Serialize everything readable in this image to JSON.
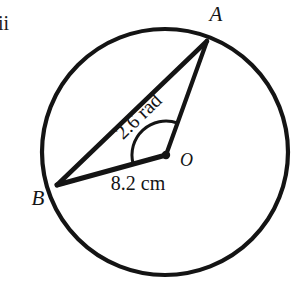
{
  "figure": {
    "kind": "circle-sector-geometry-diagram",
    "background_color": "#ffffff",
    "ink_color": "#141414",
    "question_marker": "ii",
    "circle": {
      "center_label": "O",
      "center_x": 165,
      "center_y": 152,
      "radius": 123,
      "stroke_width": 4.2
    },
    "points": [
      {
        "label": "A",
        "x": 207,
        "y": 41,
        "label_x": 216,
        "label_y": 21
      },
      {
        "label": "B",
        "x": 57,
        "y": 185,
        "label_x": 38,
        "label_y": 205
      },
      {
        "label": "O",
        "x": 166,
        "y": 155,
        "label_x": 180,
        "label_y": 166
      }
    ],
    "segments": [
      {
        "name": "radius-OA",
        "from": "O",
        "to": "A",
        "stroke_width": 4.2
      },
      {
        "name": "radius-OB",
        "from": "O",
        "to": "B",
        "stroke_width": 5.0
      },
      {
        "name": "chord-BA",
        "from": "B",
        "to": "A",
        "stroke_width": 4.6
      }
    ],
    "angle_arc": {
      "at": "O",
      "value_text": "2.6 rad",
      "radius": 34,
      "stroke_width": 3.0
    },
    "labels": {
      "angle": "2.6 rad",
      "angle_rotation_deg": -44,
      "angle_x": 143,
      "angle_y": 121,
      "length": "8.2 cm",
      "length_x": 138,
      "length_y": 190,
      "point_a": "A",
      "point_b": "B",
      "point_o": "O"
    },
    "values": {
      "angle_radians": 2.6,
      "radius_cm": 8.2,
      "angle_unit": "rad",
      "length_unit": "cm"
    }
  }
}
